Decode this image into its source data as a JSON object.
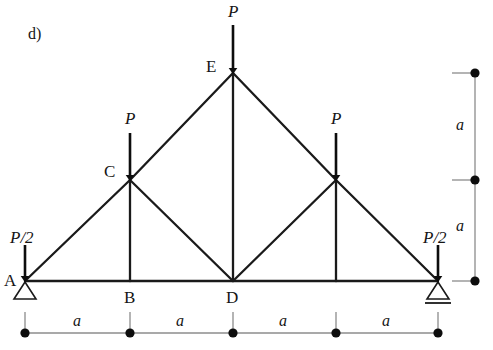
{
  "figure": {
    "part_label": "d)",
    "type": "truss-free-body-diagram",
    "colors": {
      "member": "#1a1a1a",
      "load_arrow": "#0d0d0d",
      "dimension_line": "#8c8c8c",
      "dimension_dot": "#0d0d0d",
      "support": "#1a1a1a",
      "background": "#ffffff",
      "text": "#151515"
    }
  },
  "nodes": [
    {
      "id": "A",
      "label": "A",
      "x": 25,
      "y": 281,
      "label_x": 4,
      "label_y": 272,
      "labeled": true
    },
    {
      "id": "B",
      "label": "B",
      "x": 130,
      "y": 281,
      "label_x": 124,
      "label_y": 289,
      "labeled": true
    },
    {
      "id": "D",
      "label": "D",
      "x": 233,
      "y": 281,
      "label_x": 226,
      "label_y": 289,
      "labeled": true
    },
    {
      "id": "F",
      "label": "",
      "x": 336,
      "y": 281,
      "label_x": 0,
      "label_y": 0,
      "labeled": false
    },
    {
      "id": "G",
      "label": "",
      "x": 438,
      "y": 281,
      "label_x": 0,
      "label_y": 0,
      "labeled": false
    },
    {
      "id": "C",
      "label": "C",
      "x": 130,
      "y": 180,
      "label_x": 104,
      "label_y": 163,
      "labeled": true
    },
    {
      "id": "H",
      "label": "",
      "x": 336,
      "y": 180,
      "label_x": 0,
      "label_y": 0,
      "labeled": false
    },
    {
      "id": "E",
      "label": "E",
      "x": 233,
      "y": 73,
      "label_x": 206,
      "label_y": 58,
      "labeled": true
    }
  ],
  "members": [
    {
      "name": "bottom-chord-A-B",
      "from": "A",
      "to": "B"
    },
    {
      "name": "bottom-chord-B-D",
      "from": "B",
      "to": "D"
    },
    {
      "name": "bottom-chord-D-F",
      "from": "D",
      "to": "F"
    },
    {
      "name": "bottom-chord-F-G",
      "from": "F",
      "to": "G"
    },
    {
      "name": "left-rafter-A-C",
      "from": "A",
      "to": "C"
    },
    {
      "name": "left-rafter-C-E",
      "from": "C",
      "to": "E"
    },
    {
      "name": "right-rafter-E-H",
      "from": "E",
      "to": "H"
    },
    {
      "name": "right-rafter-H-G",
      "from": "H",
      "to": "G"
    },
    {
      "name": "vertical-C-B",
      "from": "C",
      "to": "B"
    },
    {
      "name": "vertical-E-D",
      "from": "E",
      "to": "D"
    },
    {
      "name": "vertical-H-F",
      "from": "H",
      "to": "F"
    },
    {
      "name": "diagonal-C-D",
      "from": "C",
      "to": "D"
    },
    {
      "name": "diagonal-D-H",
      "from": "D",
      "to": "H"
    }
  ],
  "loads": [
    {
      "name": "load-at-A",
      "label": "P/2",
      "node": "A",
      "x": 25,
      "tail_y": 245,
      "head_y": 279,
      "label_x": 10,
      "label_y": 229
    },
    {
      "name": "load-at-C",
      "label": "P",
      "node": "C",
      "x": 130,
      "tail_y": 133,
      "head_y": 178,
      "label_x": 125,
      "label_y": 110
    },
    {
      "name": "load-at-E",
      "label": "P",
      "node": "E",
      "x": 233,
      "tail_y": 25,
      "head_y": 71,
      "label_x": 228,
      "label_y": 3
    },
    {
      "name": "load-at-H",
      "label": "P",
      "node": "H",
      "x": 336,
      "tail_y": 133,
      "head_y": 178,
      "label_x": 331,
      "label_y": 110
    },
    {
      "name": "load-at-G",
      "label": "P/2",
      "node": "G",
      "x": 438,
      "tail_y": 245,
      "head_y": 279,
      "label_x": 423,
      "label_y": 229
    }
  ],
  "supports": [
    {
      "name": "pin-support-A",
      "kind": "pin",
      "x": 25,
      "y": 281
    },
    {
      "name": "roller-support-G",
      "kind": "roller",
      "x": 438,
      "y": 281
    }
  ],
  "dimensions": {
    "horizontal": {
      "name": "horizontal-dimension-chain",
      "y": 333,
      "tick_top": 312,
      "points": [
        25,
        130,
        233,
        336,
        438
      ],
      "spans": [
        {
          "label": "a",
          "from": 25,
          "to": 130,
          "label_x": 73,
          "label_y": 313
        },
        {
          "label": "a",
          "from": 130,
          "to": 233,
          "label_x": 176,
          "label_y": 313
        },
        {
          "label": "a",
          "from": 233,
          "to": 336,
          "label_x": 279,
          "label_y": 313
        },
        {
          "label": "a",
          "from": 336,
          "to": 438,
          "label_x": 382,
          "label_y": 313
        }
      ]
    },
    "vertical": {
      "name": "vertical-dimension-chain",
      "x": 475,
      "tick_left": 452,
      "points": [
        73,
        180,
        281
      ],
      "spans": [
        {
          "label": "a",
          "from": 73,
          "to": 180,
          "label_x": 456,
          "label_y": 117
        },
        {
          "label": "a",
          "from": 180,
          "to": 281,
          "label_x": 456,
          "label_y": 218
        }
      ]
    }
  }
}
